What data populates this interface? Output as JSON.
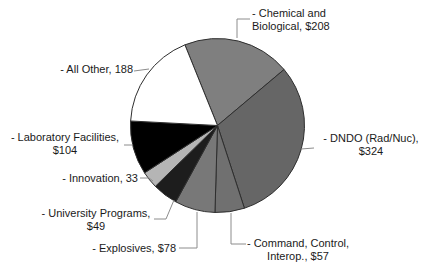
{
  "figure": {
    "background_color": "#ffffff",
    "label_text_color": "#1a1a1a",
    "slice_outline_color": "#2e2e2e",
    "leader_line_color": "#8c8c8c"
  },
  "chart_data": {
    "type": "pie",
    "title": "",
    "legend_position": "none",
    "labels_style": "outside-with-leader-lines",
    "direction": "clockwise",
    "start_angle_deg_from_top": -22,
    "total": 1041,
    "categories": [
      "Chemical and Biological",
      "DNDO (Rad/Nuc)",
      "Command, Control, Interop.",
      "Explosives",
      "University Programs",
      "Innovation",
      "Laboratory Facilities",
      "All Other"
    ],
    "values": [
      208,
      324,
      57,
      78,
      49,
      33,
      104,
      188
    ],
    "slices": [
      {
        "key": "chemical-biological",
        "name": "Chemical and Biological",
        "value": 208,
        "display_value": "$208",
        "color": "#7f7f7f",
        "label_line1": "- Chemical and",
        "label_line2": "Biological, $208"
      },
      {
        "key": "dndo-rad-nuc",
        "name": "DNDO (Rad/Nuc)",
        "value": 324,
        "display_value": "$324",
        "color": "#666666",
        "label_line1": "- DNDO (Rad/Nuc),",
        "label_line2": "$324"
      },
      {
        "key": "command-control-interop",
        "name": "Command, Control, Interop.",
        "value": 57,
        "display_value": "$57",
        "color": "#707070",
        "label_line1": "- Command, Control,",
        "label_line2": "Interop., $57"
      },
      {
        "key": "explosives",
        "name": "Explosives",
        "value": 78,
        "display_value": "$78",
        "color": "#787878",
        "label_line1": "- Explosives, $78"
      },
      {
        "key": "university-programs",
        "name": "University Programs",
        "value": 49,
        "display_value": "$49",
        "color": "#1d1d1d",
        "label_line1": "- University Programs,",
        "label_line2": "$49"
      },
      {
        "key": "innovation",
        "name": "Innovation",
        "value": 33,
        "display_value": "33",
        "color": "#b5b5b5",
        "label_line1": "- Innovation, 33"
      },
      {
        "key": "laboratory-facilities",
        "name": "Laboratory Facilities",
        "value": 104,
        "display_value": "$104",
        "color": "#000000",
        "label_line1": "- Laboratory Facilities,",
        "label_line2": "$104"
      },
      {
        "key": "all-other",
        "name": "All Other",
        "value": 188,
        "display_value": "188",
        "color": "#ffffff",
        "label_line1": "- All Other, 188"
      }
    ]
  }
}
